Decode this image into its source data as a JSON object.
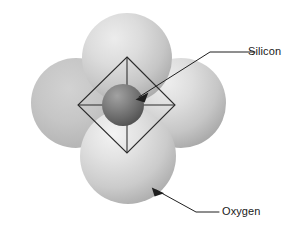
{
  "figure": {
    "background_color": "#ffffff",
    "width": 306,
    "height": 225
  },
  "labels": {
    "silicon": {
      "text": "Silicon",
      "x": 248,
      "y": 55,
      "color": "#1a1a1a"
    },
    "oxygen": {
      "text": "Oxygen",
      "x": 222,
      "y": 215,
      "color": "#1a1a1a"
    }
  },
  "atoms": {
    "silicon": {
      "name": "Silicon",
      "cx": 123,
      "cy": 105,
      "r": 21,
      "color_light": "#9a9a9a",
      "color_mid": "#6f6f6f",
      "color_dark": "#4b4b4b"
    },
    "oxygen_top": {
      "name": "Oxygen",
      "cx": 127,
      "cy": 58,
      "r": 45,
      "color_light": "#e2e2e2",
      "color_mid": "#c8c8c8",
      "color_dark": "#a8a8a8"
    },
    "oxygen_left": {
      "name": "Oxygen",
      "cx": 76,
      "cy": 103,
      "r": 45,
      "color_light": "#cdcdcd",
      "color_mid": "#bdbdbd",
      "color_dark": "#a6a6a6"
    },
    "oxygen_right": {
      "name": "Oxygen",
      "cx": 181,
      "cy": 103,
      "r": 45,
      "color_light": "#e4e4e4",
      "color_mid": "#cacaca",
      "color_dark": "#a9a9a9"
    },
    "oxygen_bottom": {
      "name": "Oxygen",
      "cx": 128,
      "cy": 156,
      "r": 48,
      "color_light": "#ededed",
      "color_mid": "#cfcfcf",
      "color_dark": "#acacac"
    }
  },
  "tetrahedron": {
    "name": "tetrahedron-outline",
    "stroke_color": "#2b2b2b",
    "vertex_top": "127,57",
    "vertex_left": "78,105",
    "vertex_right": "175,105",
    "vertex_bottom": "127,153",
    "outline_points": "127,57 175,105 127,153 78,105",
    "edge_vertical": "M 127,57 L 127,153",
    "edge_horizontal": "M 78,105 L 175,105"
  },
  "leaders": {
    "silicon": {
      "path": "M 255,52 L 210,52 L 139,97",
      "arrow_points": "136.5,98.8 147.2,93.6 143.6,101.9",
      "stroke_color": "#1f1f1f"
    },
    "oxygen": {
      "path": "M 219,212 L 196,212 L 156,190",
      "arrow_points": "152.8,188.2 163.6,192.2 155.2,195.6",
      "stroke_color": "#1f1f1f"
    }
  }
}
